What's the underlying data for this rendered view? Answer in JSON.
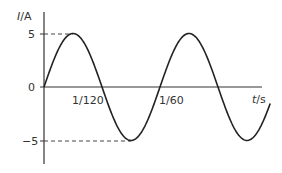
{
  "chart_data": {
    "type": "line",
    "title": "",
    "xlabel": "t/s",
    "ylabel": "I/A",
    "ylabel_var": "I",
    "ylabel_unit": "/A",
    "xlabel_var": "t",
    "xlabel_unit": "/s",
    "ylim": [
      -5,
      5
    ],
    "xlim": [
      0,
      0.0325
    ],
    "y_ticks": [
      "5",
      "0",
      "−5"
    ],
    "x_tick_labels": [
      "1/120",
      "1/60"
    ],
    "amplitude": 5,
    "period": 0.016667,
    "function": "I = 5 sin(120π t)",
    "series": [
      {
        "name": "current",
        "x": [
          0,
          0.004167,
          0.008333,
          0.0125,
          0.016667,
          0.020833,
          0.025,
          0.029167,
          0.0325
        ],
        "values": [
          0,
          5,
          0,
          -5,
          0,
          5,
          0,
          -5,
          -4.8
        ]
      }
    ],
    "reference_lines": [
      {
        "type": "dashed",
        "y": 5
      },
      {
        "type": "dashed",
        "y": -5
      }
    ],
    "grid": false,
    "legend": false
  }
}
